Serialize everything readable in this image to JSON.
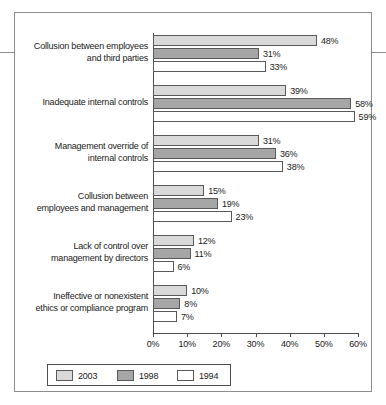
{
  "chart_data": {
    "type": "bar",
    "orientation": "horizontal",
    "title": "",
    "xlabel": "",
    "ylabel": "",
    "xlim": [
      0,
      60
    ],
    "xtick_labels": [
      "0%",
      "10%",
      "20%",
      "30%",
      "40%",
      "50%",
      "60%"
    ],
    "xticks": [
      0,
      10,
      20,
      30,
      40,
      50,
      60
    ],
    "grid": false,
    "legend_position": "bottom-left",
    "value_suffix": "%",
    "categories": [
      "Collusion between employees and third parties",
      "Inadequate internal controls",
      "Management override of internal controls",
      "Collusion between employees and management",
      "Lack of control over management by directors",
      "Ineffective or nonexistent ethics or compliance program"
    ],
    "category_lines": [
      [
        "Collusion between employees",
        "and third parties"
      ],
      [
        "Inadequate internal controls"
      ],
      [
        "Management override of",
        "internal controls"
      ],
      [
        "Collusion between",
        "employees and management"
      ],
      [
        "Lack of control over",
        "management by directors"
      ],
      [
        "Ineffective or nonexistent",
        "ethics or compliance program"
      ]
    ],
    "series": [
      {
        "name": "2003",
        "color": "#d9d9d9",
        "values": [
          48,
          39,
          31,
          15,
          12,
          10
        ],
        "labels": [
          "48%",
          "39%",
          "31%",
          "15%",
          "12%",
          "10%"
        ]
      },
      {
        "name": "1998",
        "color": "#a6a6a6",
        "values": [
          31,
          58,
          36,
          19,
          11,
          8
        ],
        "labels": [
          "31%",
          "58%",
          "36%",
          "19%",
          "11%",
          "8%"
        ]
      },
      {
        "name": "1994",
        "color": "#ffffff",
        "values": [
          33,
          59,
          38,
          23,
          6,
          7
        ],
        "labels": [
          "33%",
          "59%",
          "38%",
          "23%",
          "6%",
          "7%"
        ]
      }
    ]
  },
  "legend": {
    "items": [
      {
        "label": "2003",
        "color": "#d9d9d9"
      },
      {
        "label": "1998",
        "color": "#a6a6a6"
      },
      {
        "label": "1994",
        "color": "#ffffff"
      }
    ]
  }
}
